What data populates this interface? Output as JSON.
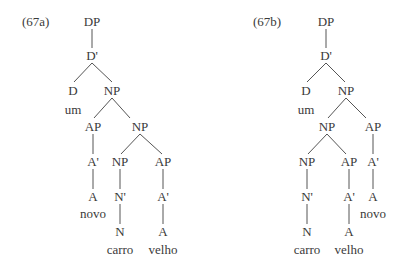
{
  "trees": [
    {
      "id": "67a",
      "example_label": "(67a)",
      "label_pos": [
        22,
        22
      ],
      "nodes": [
        {
          "text": "DP",
          "x": 92,
          "y": 22
        },
        {
          "text": "D'",
          "x": 92,
          "y": 56
        },
        {
          "text": "D",
          "x": 73,
          "y": 91
        },
        {
          "text": "um",
          "x": 73,
          "y": 110
        },
        {
          "text": "NP",
          "x": 112,
          "y": 91
        },
        {
          "text": "AP",
          "x": 93,
          "y": 127
        },
        {
          "text": "NP",
          "x": 140,
          "y": 127
        },
        {
          "text": "A'",
          "x": 93,
          "y": 162
        },
        {
          "text": "A",
          "x": 93,
          "y": 197
        },
        {
          "text": "novo",
          "x": 93,
          "y": 214
        },
        {
          "text": "NP",
          "x": 120,
          "y": 162
        },
        {
          "text": "N'",
          "x": 120,
          "y": 197
        },
        {
          "text": "N",
          "x": 120,
          "y": 232
        },
        {
          "text": "carro",
          "x": 120,
          "y": 250
        },
        {
          "text": "AP",
          "x": 163,
          "y": 162
        },
        {
          "text": "A'",
          "x": 163,
          "y": 197
        },
        {
          "text": "A",
          "x": 163,
          "y": 232
        },
        {
          "text": "velho",
          "x": 163,
          "y": 250
        }
      ],
      "edges": [
        [
          92,
          29,
          92,
          48
        ],
        [
          92,
          63,
          74,
          82
        ],
        [
          92,
          63,
          112,
          82
        ],
        [
          112,
          98,
          94,
          118
        ],
        [
          112,
          98,
          130,
          118
        ],
        [
          93,
          134,
          93,
          154
        ],
        [
          93,
          169,
          93,
          189
        ],
        [
          140,
          134,
          121,
          154
        ],
        [
          140,
          134,
          162,
          154
        ],
        [
          120,
          169,
          120,
          189
        ],
        [
          120,
          204,
          120,
          224
        ],
        [
          163,
          169,
          163,
          189
        ],
        [
          163,
          204,
          163,
          224
        ]
      ]
    },
    {
      "id": "67b",
      "example_label": "(67b)",
      "label_pos": [
        253,
        22
      ],
      "nodes": [
        {
          "text": "DP",
          "x": 326,
          "y": 22
        },
        {
          "text": "D'",
          "x": 326,
          "y": 56
        },
        {
          "text": "D",
          "x": 306,
          "y": 91
        },
        {
          "text": "um",
          "x": 306,
          "y": 110
        },
        {
          "text": "NP",
          "x": 346,
          "y": 91
        },
        {
          "text": "NP",
          "x": 327,
          "y": 127
        },
        {
          "text": "AP",
          "x": 373,
          "y": 127
        },
        {
          "text": "NP",
          "x": 307,
          "y": 162
        },
        {
          "text": "N'",
          "x": 307,
          "y": 197
        },
        {
          "text": "N",
          "x": 307,
          "y": 232
        },
        {
          "text": "carro",
          "x": 307,
          "y": 250
        },
        {
          "text": "AP",
          "x": 349,
          "y": 162
        },
        {
          "text": "A'",
          "x": 349,
          "y": 197
        },
        {
          "text": "A",
          "x": 349,
          "y": 232
        },
        {
          "text": "velho",
          "x": 349,
          "y": 250
        },
        {
          "text": "A'",
          "x": 373,
          "y": 162
        },
        {
          "text": "A",
          "x": 373,
          "y": 197
        },
        {
          "text": "novo",
          "x": 373,
          "y": 214
        }
      ],
      "edges": [
        [
          326,
          29,
          326,
          48
        ],
        [
          326,
          63,
          307,
          82
        ],
        [
          326,
          63,
          345,
          82
        ],
        [
          346,
          98,
          328,
          118
        ],
        [
          346,
          98,
          366,
          118
        ],
        [
          373,
          134,
          373,
          154
        ],
        [
          373,
          169,
          373,
          189
        ],
        [
          327,
          134,
          308,
          154
        ],
        [
          327,
          134,
          346,
          154
        ],
        [
          307,
          169,
          307,
          189
        ],
        [
          307,
          204,
          307,
          224
        ],
        [
          349,
          169,
          349,
          189
        ],
        [
          349,
          204,
          349,
          224
        ]
      ]
    }
  ]
}
